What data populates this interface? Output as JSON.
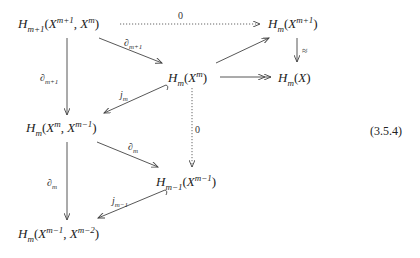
{
  "diagram": {
    "type": "commutative-diagram",
    "equation_number": "(3.5.4)",
    "nodes": [
      {
        "id": "A",
        "H_sub": "m+1",
        "args": [
          {
            "base": "X",
            "sup": "m+1"
          },
          {
            "base": "X",
            "sup": "m"
          }
        ]
      },
      {
        "id": "B",
        "H_sub": "m",
        "args": [
          {
            "base": "X",
            "sup": "m+1"
          }
        ]
      },
      {
        "id": "C",
        "H_sub": "m",
        "args": [
          {
            "base": "X",
            "sup": "m"
          }
        ]
      },
      {
        "id": "D",
        "H_sub": "m",
        "args": [
          {
            "base": "X",
            "sup": ""
          }
        ]
      },
      {
        "id": "E",
        "H_sub": "m",
        "args": [
          {
            "base": "X",
            "sup": "m"
          },
          {
            "base": "X",
            "sup": "m−1"
          }
        ]
      },
      {
        "id": "F",
        "H_sub": "m−1",
        "args": [
          {
            "base": "X",
            "sup": "m−1"
          }
        ]
      },
      {
        "id": "G",
        "H_sub": "m",
        "args": [
          {
            "base": "X",
            "sup": "m−1"
          },
          {
            "base": "X",
            "sup": "m−2"
          }
        ]
      }
    ],
    "edges": [
      {
        "from": "A",
        "to": "B",
        "label": "0",
        "style": "dotted"
      },
      {
        "from": "A",
        "to": "C",
        "label_main": "∂",
        "label_sub": "m+1",
        "style": "solid"
      },
      {
        "from": "A",
        "to": "E",
        "label_main": "∂",
        "label_sub": "m+1",
        "style": "solid"
      },
      {
        "from": "C",
        "to": "B",
        "label": "",
        "style": "solid"
      },
      {
        "from": "B",
        "to": "D",
        "label": "≈",
        "style": "solid"
      },
      {
        "from": "C",
        "to": "D",
        "label": "",
        "style": "surjective"
      },
      {
        "from": "C",
        "to": "E",
        "label_main": "j",
        "label_sub": "m",
        "style": "hook"
      },
      {
        "from": "C",
        "to": "F",
        "label": "0",
        "style": "dotted"
      },
      {
        "from": "E",
        "to": "F",
        "label_main": "∂",
        "label_sub": "m",
        "style": "solid"
      },
      {
        "from": "E",
        "to": "G",
        "label_main": "∂",
        "label_sub": "m",
        "style": "solid"
      },
      {
        "from": "F",
        "to": "G",
        "label_main": "j",
        "label_sub": "m−1",
        "style": "hook"
      }
    ]
  }
}
